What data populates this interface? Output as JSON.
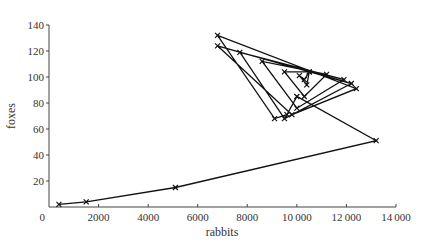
{
  "chart_data": {
    "type": "line",
    "title": "",
    "xlabel": "rabbits",
    "ylabel": "foxes",
    "xlim": [
      0,
      14000
    ],
    "ylim": [
      0,
      140
    ],
    "grid": false,
    "legend": null,
    "marker": "x",
    "x_ticks": [
      "0",
      "2000",
      "4000",
      "6000",
      "8000",
      "10000",
      "12000",
      "14000"
    ],
    "y_ticks": [
      "20",
      "40",
      "60",
      "80",
      "100",
      "120",
      "140"
    ],
    "series": [
      {
        "name": "trajectory",
        "points": [
          [
            400,
            2
          ],
          [
            1500,
            4
          ],
          [
            5100,
            15
          ],
          [
            13200,
            51
          ],
          [
            10000,
            85
          ],
          [
            9600,
            71
          ],
          [
            9100,
            68
          ],
          [
            6800,
            132
          ],
          [
            12400,
            91
          ],
          [
            9800,
            71
          ],
          [
            6800,
            124
          ],
          [
            12200,
            95
          ],
          [
            9500,
            68
          ],
          [
            7700,
            119
          ],
          [
            11900,
            98
          ],
          [
            10000,
            76
          ],
          [
            8600,
            112
          ],
          [
            11200,
            102
          ],
          [
            10300,
            85
          ],
          [
            9500,
            104
          ],
          [
            10500,
            104
          ],
          [
            10300,
            98
          ],
          [
            10100,
            101
          ],
          [
            10400,
            94
          ],
          [
            10500,
            104
          ]
        ]
      }
    ]
  }
}
